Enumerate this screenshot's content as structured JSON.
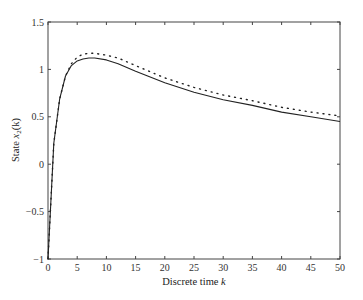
{
  "chart_data": {
    "type": "line",
    "title": "",
    "xlabel": "Discrete time k",
    "ylabel": "State x2(k)",
    "xlabel_parts": {
      "text": "Discrete time ",
      "var": "k"
    },
    "ylabel_parts": {
      "text": "State ",
      "var": "x",
      "sub": "2",
      "arg": "(k)"
    },
    "xlim": [
      0,
      50
    ],
    "ylim": [
      -1,
      1.5
    ],
    "xticks": [
      0,
      5,
      10,
      15,
      20,
      25,
      30,
      35,
      40,
      45,
      50
    ],
    "yticks": [
      -1,
      -0.5,
      0,
      0.5,
      1,
      1.5
    ],
    "ytick_labels": [
      "−1",
      "−0.5",
      "0",
      "0.5",
      "1",
      "1.5"
    ],
    "grid": false,
    "legend": null,
    "x": [
      0,
      1,
      2,
      3,
      4,
      5,
      6,
      7,
      8,
      10,
      12,
      15,
      20,
      25,
      30,
      35,
      40,
      45,
      50
    ],
    "series": [
      {
        "name": "solid",
        "style": "solid",
        "color": "#222222",
        "values": [
          -1.0,
          0.22,
          0.69,
          0.93,
          1.04,
          1.09,
          1.11,
          1.12,
          1.12,
          1.1,
          1.06,
          0.98,
          0.86,
          0.76,
          0.68,
          0.62,
          0.55,
          0.5,
          0.45
        ]
      },
      {
        "name": "dotted",
        "style": "dotted",
        "color": "#222222",
        "values": [
          -1.0,
          0.22,
          0.69,
          0.93,
          1.06,
          1.13,
          1.16,
          1.17,
          1.17,
          1.15,
          1.12,
          1.04,
          0.91,
          0.81,
          0.73,
          0.67,
          0.6,
          0.55,
          0.51
        ]
      }
    ]
  }
}
